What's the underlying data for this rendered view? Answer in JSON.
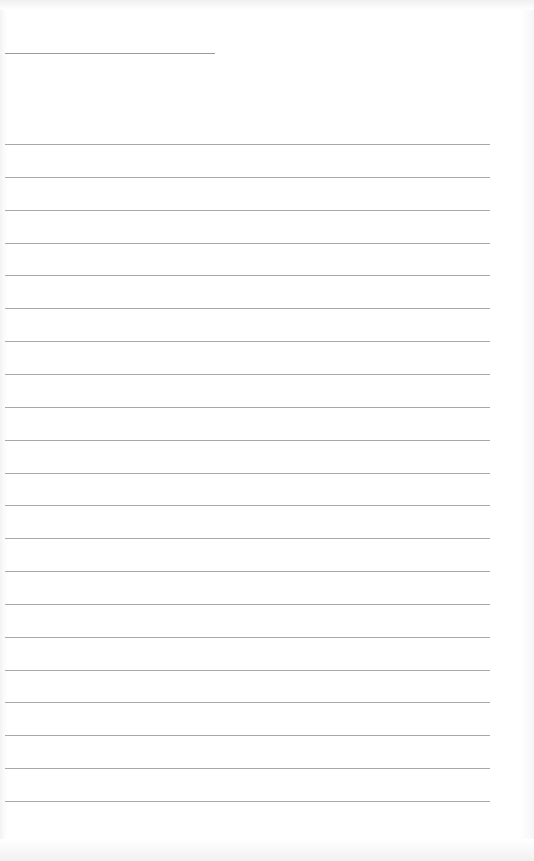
{
  "document": {
    "type": "blank lined paper",
    "header_line": {
      "x": 5,
      "y": 53,
      "length": 210
    },
    "ruled_lines": {
      "count": 21,
      "first_y": 144,
      "spacing": 32.85,
      "x": 5,
      "length": 485
    },
    "colors": {
      "paper": "#ffffff",
      "line": "#a8a8a8"
    }
  }
}
